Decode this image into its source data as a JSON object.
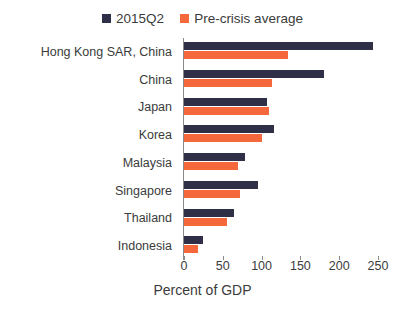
{
  "chart_data": {
    "type": "bar",
    "orientation": "horizontal",
    "title": "",
    "xlabel": "Percent of GDP",
    "ylabel": "",
    "xlim": [
      0,
      250
    ],
    "xticks": [
      0,
      50,
      100,
      150,
      200,
      250
    ],
    "xtick_labels": [
      "0",
      "50",
      "100",
      "150",
      "200",
      "250"
    ],
    "grid": false,
    "legend_position": "top-center",
    "categories": [
      "Hong Kong SAR, China",
      "China",
      "Japan",
      "Korea",
      "Malaysia",
      "Singapore",
      "Thailand",
      "Indonesia"
    ],
    "series": [
      {
        "name": "2015Q2",
        "color": "#2f2f48",
        "values": [
          243,
          180,
          107,
          116,
          78,
          96,
          64,
          25
        ]
      },
      {
        "name": "Pre-crisis average",
        "color": "#f4683c",
        "values": [
          134,
          113,
          110,
          100,
          69,
          72,
          56,
          18
        ]
      }
    ]
  },
  "legend": {
    "entries": [
      {
        "label": "2015Q2",
        "color": "#2f2f48"
      },
      {
        "label": "Pre-crisis average",
        "color": "#f4683c"
      }
    ]
  },
  "axis": {
    "title": "Percent of GDP"
  }
}
